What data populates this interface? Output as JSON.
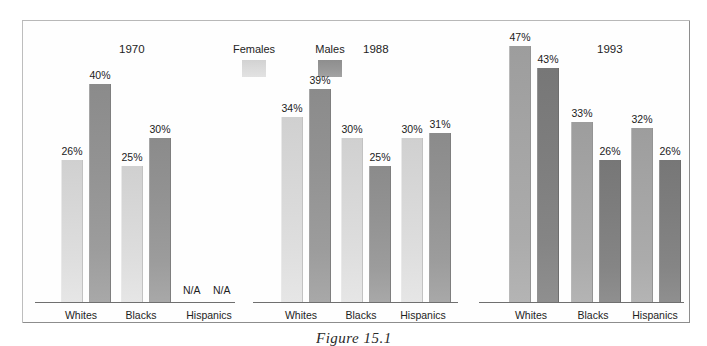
{
  "figure": {
    "caption": "Figure 15.1",
    "legend": {
      "female_label": "Females",
      "male_label": "Males",
      "female_swatch_icon": "legend-swatch-light-gray",
      "male_swatch_icon": "legend-swatch-dark-gray"
    },
    "na_text": "N/A",
    "colors": {
      "female_light": "#d8d8d8",
      "male_light": "#979797",
      "female_dark": "#a4a4a4",
      "male_dark": "#7d7d7d",
      "frame": "#8d8d8d",
      "axis": "#6f6f6f",
      "text": "#1d1d1d"
    }
  },
  "chart_data": {
    "type": "bar",
    "title": "",
    "xlabel": "",
    "ylabel": "",
    "ylim": [
      0,
      50
    ],
    "grid": false,
    "legend_position": "top-center",
    "panels": [
      {
        "year": "1970",
        "categories": [
          "Whites",
          "Blacks",
          "Hispanics"
        ],
        "series": [
          {
            "name": "Females",
            "values": [
              26,
              25,
              null
            ],
            "labels": [
              "26%",
              "25%",
              "N/A"
            ]
          },
          {
            "name": "Males",
            "values": [
              40,
              30,
              null
            ],
            "labels": [
              "40%",
              "30%",
              "N/A"
            ]
          }
        ]
      },
      {
        "year": "1988",
        "categories": [
          "Whites",
          "Blacks",
          "Hispanics"
        ],
        "series": [
          {
            "name": "Females",
            "values": [
              34,
              30,
              30
            ],
            "labels": [
              "34%",
              "30%",
              "30%"
            ]
          },
          {
            "name": "Males",
            "values": [
              39,
              25,
              31
            ],
            "labels": [
              "39%",
              "25%",
              "31%"
            ]
          }
        ]
      },
      {
        "year": "1993",
        "categories": [
          "Whites",
          "Blacks",
          "Hispanics"
        ],
        "series": [
          {
            "name": "Females",
            "values": [
              47,
              33,
              32
            ],
            "labels": [
              "47%",
              "33%",
              "32%"
            ]
          },
          {
            "name": "Males",
            "values": [
              43,
              26,
              26
            ],
            "labels": [
              "43%",
              "26%",
              "26%"
            ]
          }
        ]
      }
    ]
  },
  "layout": {
    "baseline_y": 281,
    "px_per_unit": 5.45,
    "panels": [
      {
        "year": "1970",
        "title_x": 96,
        "title_y": 22,
        "axis_x": 12,
        "axis_w": 200,
        "dark": false,
        "groups": [
          {
            "label": "Whites",
            "label_cx": 58,
            "bars_x": [
              38,
              66
            ]
          },
          {
            "label": "Blacks",
            "label_cx": 118,
            "bars_x": [
              98,
              126
            ]
          },
          {
            "label": "Hispanics",
            "label_cx": 186,
            "bars_x": [
              158,
              186
            ],
            "na": true
          }
        ]
      },
      {
        "year": "1988",
        "title_x": 340,
        "title_y": 22,
        "axis_x": 230,
        "axis_w": 205,
        "dark": false,
        "groups": [
          {
            "label": "Whites",
            "label_cx": 278,
            "bars_x": [
              258,
              286
            ]
          },
          {
            "label": "Blacks",
            "label_cx": 338,
            "bars_x": [
              318,
              346
            ]
          },
          {
            "label": "Hispanics",
            "label_cx": 400,
            "bars_x": [
              378,
              406
            ]
          }
        ]
      },
      {
        "year": "1993",
        "title_x": 574,
        "title_y": 22,
        "axis_x": 456,
        "axis_w": 205,
        "dark": true,
        "groups": [
          {
            "label": "Whites",
            "label_cx": 508,
            "bars_x": [
              486,
              514
            ]
          },
          {
            "label": "Blacks",
            "label_cx": 570,
            "bars_x": [
              548,
              576
            ]
          },
          {
            "label": "Hispanics",
            "label_cx": 632,
            "bars_x": [
              608,
              636
            ]
          }
        ]
      }
    ],
    "bar_width": 22,
    "na_positions": [
      {
        "x": 160
      },
      {
        "x": 190
      }
    ]
  }
}
